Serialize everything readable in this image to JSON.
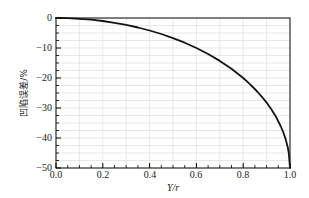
{
  "chart_data": {
    "type": "line",
    "title": "",
    "xlabel": "Y/r",
    "ylabel": "凹陷误差/%",
    "xlim": [
      0,
      1.0
    ],
    "ylim": [
      -50,
      0
    ],
    "xticks": [
      0,
      0.2,
      0.4,
      0.6,
      0.8,
      1.0
    ],
    "xtick_labels": [
      "0.0",
      "0.2",
      "0.4",
      "0.6",
      "0.8",
      "1.0"
    ],
    "yticks": [
      0,
      -10,
      -20,
      -30,
      -40,
      -50
    ],
    "ytick_labels": [
      "0",
      "−10",
      "−20",
      "−30",
      "−40",
      "−50"
    ],
    "x_minor_step": 0.05,
    "y_minor_step": 2.5,
    "x_grid_step": 0.1,
    "y_grid_step": 2.5,
    "grid": "minor-gridlines-on",
    "legend": "none",
    "axis_color": "#000000",
    "grid_color": "#d9d9d9",
    "curve_color": "#141414",
    "series": [
      {
        "name": "dent-error-curve",
        "x": [
          0,
          0.05,
          0.1,
          0.15,
          0.2,
          0.25,
          0.3,
          0.35,
          0.4,
          0.45,
          0.5,
          0.55,
          0.6,
          0.65,
          0.7,
          0.75,
          0.8,
          0.83,
          0.86,
          0.88,
          0.9,
          0.92,
          0.94,
          0.96,
          0.97,
          0.98,
          0.99,
          0.995,
          1.0
        ],
        "y": [
          0,
          -0.06,
          -0.25,
          -0.57,
          -1.01,
          -1.59,
          -2.3,
          -3.16,
          -4.17,
          -5.35,
          -6.7,
          -8.24,
          -10,
          -12,
          -14.29,
          -16.93,
          -20,
          -22.11,
          -24.49,
          -26.25,
          -28.21,
          -30.4,
          -32.94,
          -36,
          -37.84,
          -40.05,
          -42.95,
          -45.01,
          -50
        ]
      }
    ]
  }
}
